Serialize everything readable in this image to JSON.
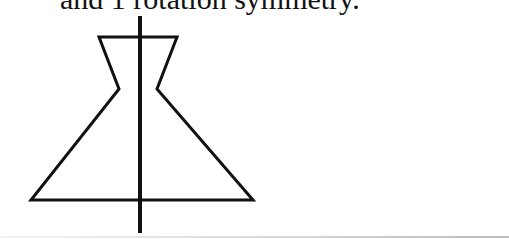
{
  "caption": {
    "text": "and 1 rotation symmetry."
  },
  "figure": {
    "stroke_color": "#111111",
    "outline_stroke_width": 3,
    "axis_stroke_width": 4,
    "outline_points": [
      [
        99,
        37
      ],
      [
        177,
        37
      ],
      [
        157,
        89
      ],
      [
        253,
        200
      ],
      [
        31,
        200
      ],
      [
        119,
        89
      ],
      [
        99,
        37
      ]
    ],
    "symmetry_axis": {
      "x": 140,
      "y_top": 16,
      "y_bottom": 233
    }
  }
}
